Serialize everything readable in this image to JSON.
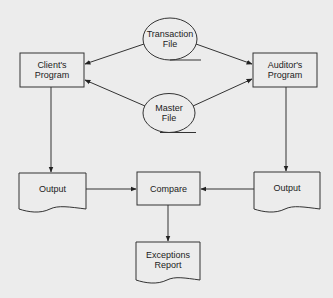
{
  "diagram": {
    "type": "flowchart",
    "colors": {
      "background": "#ececec",
      "stroke": "#333333",
      "text": "#222222"
    },
    "nodes": {
      "transaction_file": {
        "label_line1": "Transaction",
        "label_line2": "File",
        "shape": "magnetic-tape-file"
      },
      "master_file": {
        "label_line1": "Master",
        "label_line2": "File",
        "shape": "magnetic-tape-file"
      },
      "clients_program": {
        "label_line1": "Client's",
        "label_line2": "Program",
        "shape": "process"
      },
      "auditors_program": {
        "label_line1": "Auditor's",
        "label_line2": "Program",
        "shape": "process"
      },
      "output_left": {
        "label": "Output",
        "shape": "document"
      },
      "output_right": {
        "label": "Output",
        "shape": "document"
      },
      "compare": {
        "label": "Compare",
        "shape": "process"
      },
      "exceptions_report": {
        "label_line1": "Exceptions",
        "label_line2": "Report",
        "shape": "document"
      }
    },
    "edges": [
      {
        "from": "Transaction File",
        "to": "Client's Program"
      },
      {
        "from": "Transaction File",
        "to": "Auditor's Program"
      },
      {
        "from": "Master File",
        "to": "Client's Program"
      },
      {
        "from": "Master File",
        "to": "Auditor's Program"
      },
      {
        "from": "Client's Program",
        "to": "Output (left)"
      },
      {
        "from": "Auditor's Program",
        "to": "Output (right)"
      },
      {
        "from": "Output (left)",
        "to": "Compare"
      },
      {
        "from": "Output (right)",
        "to": "Compare"
      },
      {
        "from": "Compare",
        "to": "Exceptions Report"
      }
    ]
  }
}
